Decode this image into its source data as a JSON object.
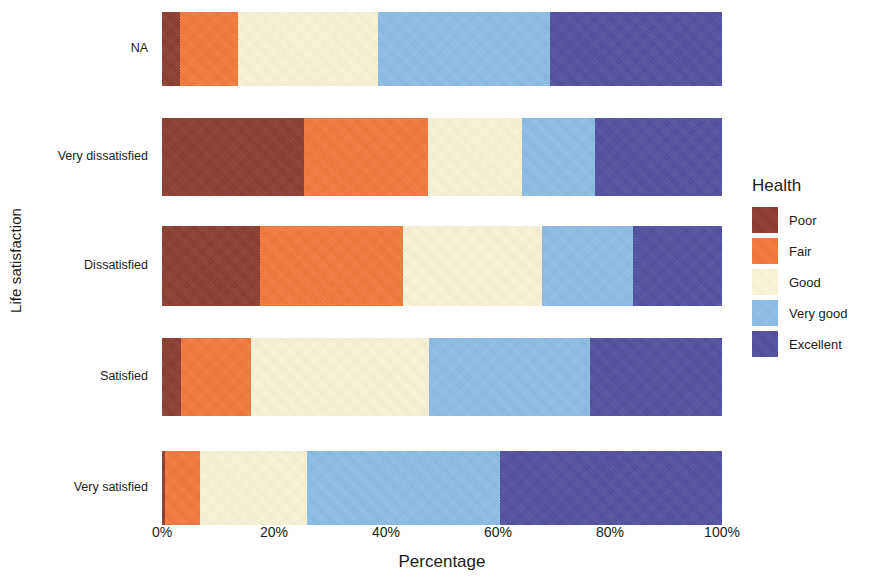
{
  "chart_data": {
    "type": "bar",
    "orientation": "horizontal",
    "stacked": true,
    "normalized": "percent",
    "title": "",
    "xlabel": "Percentage",
    "ylabel": "Life satisfaction",
    "xlim": [
      0,
      100
    ],
    "xticks": [
      0,
      20,
      40,
      60,
      80,
      100
    ],
    "xticklabels": [
      "0%",
      "20%",
      "40%",
      "60%",
      "80%",
      "100%"
    ],
    "grid": false,
    "legend": {
      "title": "Health",
      "position": "right"
    },
    "categories": [
      "NA",
      "Very dissatisfied",
      "Dissatisfied",
      "Satisfied",
      "Very satisfied"
    ],
    "series": [
      {
        "name": "Poor",
        "color": "#8C3B2E",
        "values": [
          3.2,
          25.4,
          17.5,
          3.4,
          0.5
        ]
      },
      {
        "name": "Fair",
        "color": "#F4793B",
        "values": [
          10.4,
          22.1,
          25.5,
          12.5,
          6.3
        ]
      },
      {
        "name": "Good",
        "color": "#FBF6D9",
        "values": [
          25.0,
          16.8,
          24.9,
          31.8,
          19.1
        ]
      },
      {
        "name": "Very good",
        "color": "#8DBDE7",
        "values": [
          30.7,
          13.0,
          16.2,
          28.7,
          34.5
        ]
      },
      {
        "name": "Excellent",
        "color": "#514FA0",
        "values": [
          30.7,
          22.7,
          15.9,
          23.6,
          39.6
        ]
      }
    ]
  },
  "axes": {
    "y_title": "Life satisfaction",
    "x_title": "Percentage",
    "y_tick_labels": [
      "NA",
      "Very dissatisfied",
      "Dissatisfied",
      "Satisfied",
      "Very satisfied"
    ],
    "x_tick_labels": [
      "0%",
      "20%",
      "40%",
      "60%",
      "80%",
      "100%"
    ]
  },
  "legend": {
    "title": "Health",
    "items": [
      {
        "label": "Poor",
        "color": "#8C3B2E"
      },
      {
        "label": "Fair",
        "color": "#F4793B"
      },
      {
        "label": "Good",
        "color": "#FBF6D9"
      },
      {
        "label": "Very good",
        "color": "#8DBDE7"
      },
      {
        "label": "Excellent",
        "color": "#514FA0"
      }
    ]
  }
}
